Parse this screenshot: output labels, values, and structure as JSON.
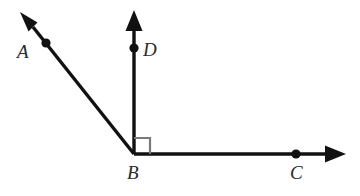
{
  "figure": {
    "kind": "geometry-diagram",
    "background_color": "#ffffff",
    "stroke_color": "#111111",
    "label_color": "#2a2a2a",
    "right_angle_color": "#7a7a7a",
    "labels": {
      "A": "A",
      "B": "B",
      "C": "C",
      "D": "D"
    },
    "points": {
      "vertex": {
        "name": "B",
        "x": 134,
        "y": 154
      },
      "A": {
        "name": "A",
        "x": 46,
        "y": 43
      },
      "D": {
        "name": "D",
        "x": 134,
        "y": 48
      },
      "C": {
        "name": "C",
        "x": 296,
        "y": 154
      }
    },
    "rays": [
      {
        "name": "ray-BA",
        "from": "B",
        "through": "A",
        "tip_x": 22,
        "tip_y": 14,
        "arrow": true
      },
      {
        "name": "ray-BD",
        "from": "B",
        "through": "D",
        "tip_x": 134,
        "tip_y": 12,
        "arrow": true
      },
      {
        "name": "ray-BC",
        "from": "B",
        "through": "C",
        "tip_x": 345,
        "tip_y": 154,
        "arrow": true
      }
    ],
    "angle_markers": [
      {
        "name": "right-angle-DBC",
        "between": [
          "ray-BD",
          "ray-BC"
        ],
        "size": 16,
        "measure": "90"
      }
    ]
  }
}
